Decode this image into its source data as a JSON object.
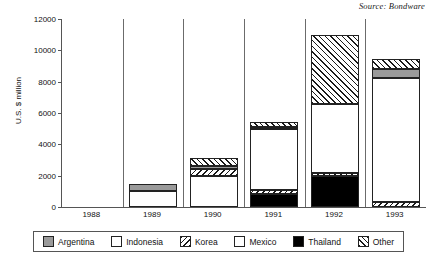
{
  "source_note": "Source: Bondware",
  "chart_data": {
    "type": "bar",
    "stacked": true,
    "title": "",
    "subtitle": "",
    "xlabel": "",
    "ylabel": "U.S. $ million",
    "ylim": [
      0,
      12000
    ],
    "ytick_values": [
      0,
      2000,
      4000,
      6000,
      8000,
      10000,
      12000
    ],
    "ytick_labels": [
      "0",
      "2000",
      "4000",
      "6000",
      "8000",
      "10000",
      "12000"
    ],
    "grid": false,
    "legend_position": "bottom",
    "categories": [
      "1988",
      "1989",
      "1990",
      "1991",
      "1992",
      "1993"
    ],
    "series": [
      {
        "name": "Argentina",
        "key": "argentina",
        "color": "#9a9a9a",
        "pattern": "solid-gray",
        "values": [
          0,
          500,
          150,
          100,
          0,
          550
        ]
      },
      {
        "name": "Indonesia",
        "key": "indonesia",
        "color": "#ffffff",
        "pattern": "solid-white",
        "values": [
          0,
          1000,
          2000,
          0,
          0,
          0
        ]
      },
      {
        "name": "Korea",
        "key": "korea",
        "color": "#ffffff",
        "pattern": "hatch-backslash",
        "values": [
          0,
          0,
          450,
          300,
          250,
          330
        ]
      },
      {
        "name": "Mexico",
        "key": "mexico",
        "color": "#ffffff",
        "pattern": "solid-white",
        "values": [
          0,
          0,
          0,
          3900,
          4350,
          7920
        ]
      },
      {
        "name": "Thailand",
        "key": "thailand",
        "color": "#000000",
        "pattern": "solid-black",
        "values": [
          0,
          0,
          0,
          800,
          1950,
          0
        ]
      },
      {
        "name": "Other",
        "key": "other",
        "color": "#ffffff",
        "pattern": "hatch-slash",
        "values": [
          0,
          0,
          500,
          300,
          4400,
          650
        ]
      }
    ],
    "totals": [
      0,
      1500,
      3100,
      5400,
      10950,
      9450
    ],
    "stack_order": [
      "thailand",
      "korea",
      "indonesia",
      "mexico",
      "argentina",
      "other"
    ],
    "bars": [
      {
        "category": "1988",
        "total": 0,
        "segments": []
      },
      {
        "category": "1989",
        "total": 1500,
        "segments": [
          {
            "key": "indonesia",
            "name": "Indonesia",
            "y0": 0,
            "y1": 1000
          },
          {
            "key": "argentina",
            "name": "Argentina",
            "y0": 1000,
            "y1": 1500
          }
        ]
      },
      {
        "category": "1990",
        "total": 3100,
        "segments": [
          {
            "key": "indonesia",
            "name": "Indonesia",
            "y0": 0,
            "y1": 2000
          },
          {
            "key": "korea",
            "name": "Korea",
            "y0": 2000,
            "y1": 2450
          },
          {
            "key": "argentina",
            "name": "Argentina",
            "y0": 2450,
            "y1": 2600
          },
          {
            "key": "other",
            "name": "Other",
            "y0": 2600,
            "y1": 3100
          }
        ]
      },
      {
        "category": "1991",
        "total": 5400,
        "segments": [
          {
            "key": "thailand",
            "name": "Thailand",
            "y0": 0,
            "y1": 800
          },
          {
            "key": "korea",
            "name": "Korea",
            "y0": 800,
            "y1": 1100
          },
          {
            "key": "mexico",
            "name": "Mexico",
            "y0": 1100,
            "y1": 5000
          },
          {
            "key": "argentina",
            "name": "Argentina",
            "y0": 5000,
            "y1": 5100
          },
          {
            "key": "other",
            "name": "Other",
            "y0": 5100,
            "y1": 5400
          }
        ]
      },
      {
        "category": "1992",
        "total": 10950,
        "segments": [
          {
            "key": "thailand",
            "name": "Thailand",
            "y0": 0,
            "y1": 1950
          },
          {
            "key": "korea",
            "name": "Korea",
            "y0": 1950,
            "y1": 2200
          },
          {
            "key": "mexico",
            "name": "Mexico",
            "y0": 2200,
            "y1": 6550
          },
          {
            "key": "other",
            "name": "Other",
            "y0": 6550,
            "y1": 10950
          }
        ]
      },
      {
        "category": "1993",
        "total": 9450,
        "segments": [
          {
            "key": "korea",
            "name": "Korea",
            "y0": 0,
            "y1": 330
          },
          {
            "key": "mexico",
            "name": "Mexico",
            "y0": 330,
            "y1": 8250
          },
          {
            "key": "argentina",
            "name": "Argentina",
            "y0": 8250,
            "y1": 8800
          },
          {
            "key": "other",
            "name": "Other",
            "y0": 8800,
            "y1": 9450
          }
        ]
      }
    ],
    "legend": [
      {
        "label": "Argentina",
        "key": "argentina"
      },
      {
        "label": "Indonesia",
        "key": "indonesia"
      },
      {
        "label": "Korea",
        "key": "korea"
      },
      {
        "label": "Mexico",
        "key": "mexico"
      },
      {
        "label": "Thailand",
        "key": "thailand"
      },
      {
        "label": "Other",
        "key": "other"
      }
    ]
  }
}
